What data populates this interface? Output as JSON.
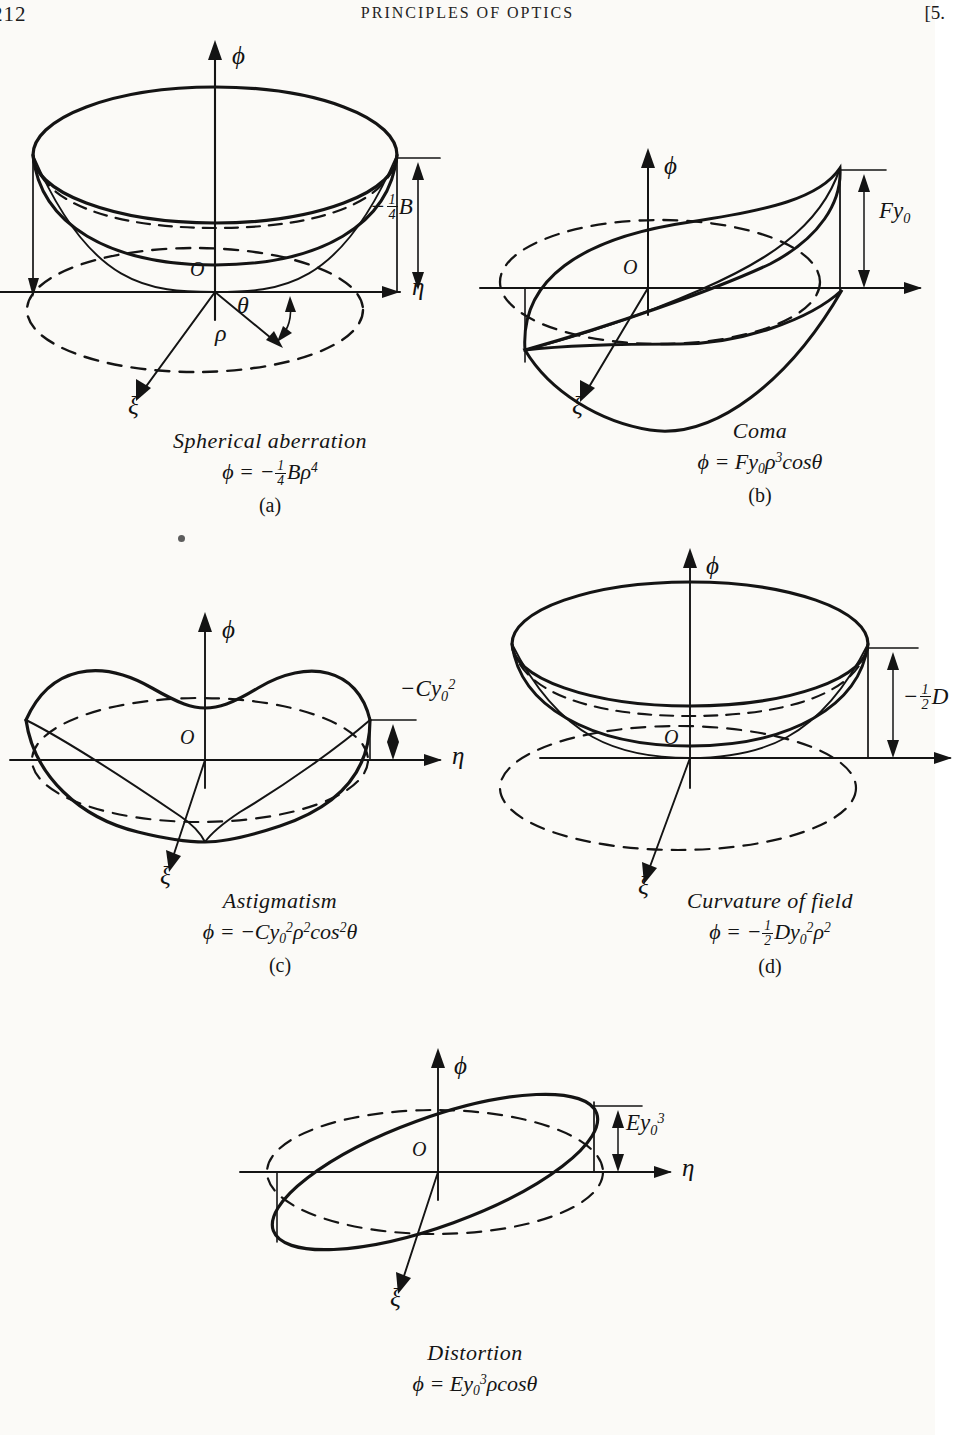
{
  "page": {
    "folio": "212",
    "running_title": "PRINCIPLES OF OPTICS",
    "chapter_marker": "[5."
  },
  "figures": [
    {
      "id": "a",
      "letter": "(a)",
      "name": "Spherical aberration",
      "formula_plain": "ϕ = -¼Bρ⁴",
      "amplitude_label": "−¼B",
      "axes": {
        "vertical": "ϕ",
        "horizontal": "η",
        "depth": "ξ",
        "origin": "O"
      },
      "extra_labels": {
        "angle": "θ",
        "radius": "ρ"
      },
      "surface": "paraboloid-dish-rho4"
    },
    {
      "id": "b",
      "letter": "(b)",
      "name": "Coma",
      "formula_plain": "ϕ = Fy₀ρ³cosθ",
      "amplitude_label": "Fy₀",
      "axes": {
        "vertical": "ϕ",
        "horizontal": "",
        "depth": "ξ",
        "origin": "O"
      },
      "extra_labels": {},
      "surface": "coma-leaf"
    },
    {
      "id": "c",
      "letter": "(c)",
      "name": "Astigmatism",
      "formula_plain": "ϕ = -Cy₀²ρ²cos²θ",
      "amplitude_label": "−Cy₀²",
      "axes": {
        "vertical": "ϕ",
        "horizontal": "η",
        "depth": "ξ",
        "origin": "O"
      },
      "extra_labels": {},
      "surface": "saddle"
    },
    {
      "id": "d",
      "letter": "(d)",
      "name": "Curvature of field",
      "formula_plain": "ϕ = -½Dy₀²ρ²",
      "amplitude_label": "−½D",
      "axes": {
        "vertical": "ϕ",
        "horizontal": "",
        "depth": "ξ",
        "origin": "O"
      },
      "extra_labels": {},
      "surface": "paraboloid-bowl"
    },
    {
      "id": "e",
      "letter": "(e)",
      "name": "Distortion",
      "formula_plain": "ϕ = Ey₀³ρcosθ",
      "amplitude_label": "Ey₀³",
      "axes": {
        "vertical": "ϕ",
        "horizontal": "η",
        "depth": "ξ",
        "origin": "O"
      },
      "extra_labels": {},
      "surface": "tilted-plane"
    }
  ],
  "symbols": {
    "phi": "ϕ",
    "eta": "η",
    "xi": "ξ",
    "rho": "ρ",
    "theta": "θ",
    "origin": "O",
    "minus": "−",
    "equals": "=",
    "B": "B",
    "C": "C",
    "D": "D",
    "E": "E",
    "F": "F",
    "y": "y",
    "cos": "cos",
    "one": "1",
    "two": "2",
    "four": "4",
    "zero": "0",
    "three": "3"
  },
  "colors": {
    "ink": "#141414",
    "paper": "#fbfaf7",
    "rule": "#1b1b1b"
  }
}
